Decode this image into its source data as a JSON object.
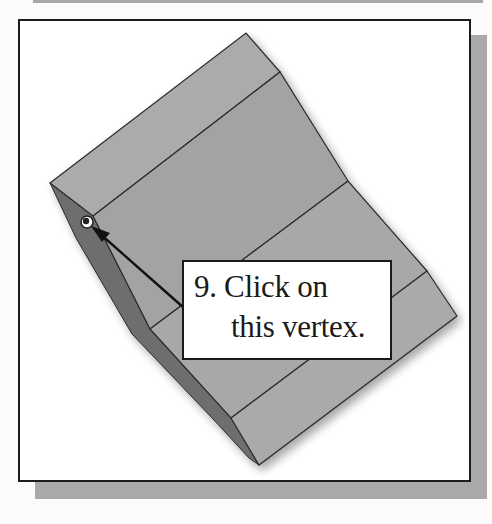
{
  "figure": {
    "step_number": "9.",
    "callout": {
      "line1": "9. Click on",
      "line2": "this vertex."
    },
    "target": "vertex",
    "colors": {
      "face": "#a4a4a4",
      "face_light": "#acacac",
      "side_face": "#6e6e6e",
      "edge": "#2a2a2a",
      "frame_border": "#1c1c1c",
      "frame_shadow": "#a9a9a9",
      "background": "#ffffff"
    }
  }
}
